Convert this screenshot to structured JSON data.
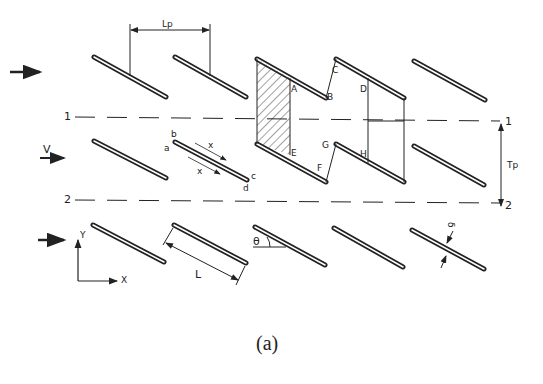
{
  "figure": {
    "caption": "(a)"
  },
  "labels": {
    "pitch_length": "Lp",
    "transverse_pitch": "Tp",
    "velocity": "V",
    "plate_length": "L",
    "angle": "θ",
    "thickness": "δ",
    "axis_x": "X",
    "axis_y": "Y",
    "line1_left": "1",
    "line1_right": "1",
    "line2_left": "2",
    "line2_right": "2",
    "flow_x_upper": "x",
    "flow_x_lower": "x"
  },
  "plate_corner_labels": {
    "a": "a",
    "b": "b",
    "c": "c",
    "d": "d"
  },
  "control_volume_labels": {
    "A": "A",
    "B": "B",
    "C": "C",
    "D": "D",
    "E": "E",
    "F": "F",
    "G": "G",
    "H": "H"
  },
  "colors": {
    "ink": "#222222",
    "background": "#ffffff"
  }
}
